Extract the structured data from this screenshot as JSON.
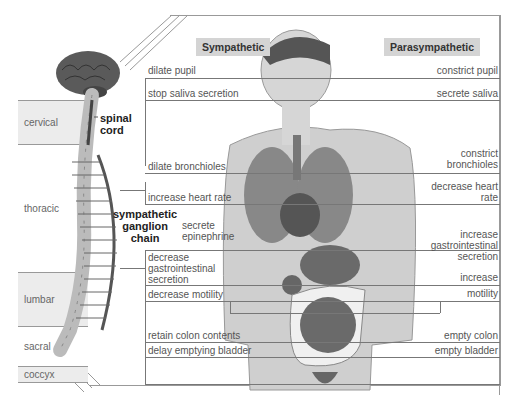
{
  "headers": {
    "sympathetic": "Sympathetic",
    "parasympathetic": "Parasympathetic"
  },
  "spine_regions": [
    {
      "label": "cervical"
    },
    {
      "label": "thoracic"
    },
    {
      "label": "lumbar"
    },
    {
      "label": "sacral"
    },
    {
      "label": "coccyx"
    }
  ],
  "anatomy_labels": {
    "spinal_cord": "spinal\ncord",
    "ganglion_chain": "sympathetic\nganglion\nchain"
  },
  "sympathetic_effects": [
    "dilate pupil",
    "stop saliva secretion",
    "dilate bronchioles",
    "increase heart rate",
    "secrete epinephrine",
    "decrease gastrointestinal secretion",
    "decrease motility",
    "retain colon contents",
    "delay emptying bladder"
  ],
  "parasympathetic_effects": [
    "constrict pupil",
    "secrete saliva",
    "constrict bronchioles",
    "decrease heart rate",
    "increase gastrointestinal secretion",
    "increase motility",
    "empty colon",
    "empty bladder"
  ],
  "colors": {
    "header_bg": "#d4d4d4",
    "line": "#777777",
    "region_bg": "#ececec",
    "organ": "#666666"
  }
}
